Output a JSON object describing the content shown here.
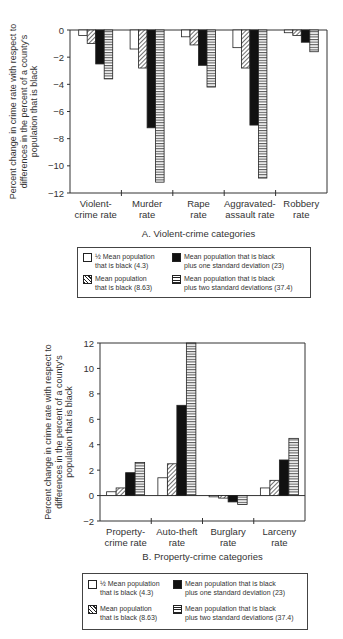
{
  "chart_data": [
    {
      "type": "bar",
      "title": "A. Violent-crime categories",
      "xlabel": "",
      "ylabel": "Percent change in crime rate with respect to differences in the percent of a county's population that is  black",
      "ylim": [
        -12,
        0
      ],
      "yticks": [
        0,
        -2,
        -4,
        -6,
        -8,
        -10,
        -12
      ],
      "grid": false,
      "legend_position": "below",
      "categories": [
        "Violent-crime rate",
        "Murder rate",
        "Rape rate",
        "Aggravated-assault rate",
        "Robbery rate"
      ],
      "category_lines": [
        [
          "Violent-",
          "crime rate"
        ],
        [
          "Murder",
          "rate"
        ],
        [
          "Rape",
          "rate"
        ],
        [
          "Aggravated-",
          "assault rate"
        ],
        [
          "Robbery",
          "rate"
        ]
      ],
      "series": [
        {
          "name": "1/2 Mean population that is black (4.3)",
          "pattern": "white",
          "values": [
            -0.4,
            -1.4,
            -0.5,
            -1.3,
            -0.2
          ]
        },
        {
          "name": "Mean population that is black (8.63)",
          "pattern": "hatch",
          "values": [
            -1.0,
            -2.8,
            -1.1,
            -2.8,
            -0.4
          ]
        },
        {
          "name": "Mean population that is black plus one standard deviation (23)",
          "pattern": "black",
          "values": [
            -2.5,
            -7.2,
            -2.6,
            -7.0,
            -0.9
          ]
        },
        {
          "name": "Mean population that is black plus two standard deviations (37.4)",
          "pattern": "lines",
          "values": [
            -3.6,
            -11.2,
            -4.2,
            -10.9,
            -1.6
          ]
        }
      ]
    },
    {
      "type": "bar",
      "title": "B. Property-crime categories",
      "xlabel": "",
      "ylabel": "Percent change in crime rate with respect to differences in the percent of a county's population that is  black",
      "ylim": [
        -2,
        12
      ],
      "yticks": [
        12,
        10,
        8,
        6,
        4,
        2,
        0,
        -2
      ],
      "grid": false,
      "legend_position": "below",
      "categories": [
        "Property-crime rate",
        "Auto-theft rate",
        "Burglary rate",
        "Larceny rate"
      ],
      "category_lines": [
        [
          "Property-",
          "crime rate"
        ],
        [
          "Auto-theft",
          "rate"
        ],
        [
          "Burglary",
          "rate"
        ],
        [
          "Larceny",
          "rate"
        ]
      ],
      "series": [
        {
          "name": "1/2 Mean population that is black (4.3)",
          "pattern": "white",
          "values": [
            0.3,
            1.4,
            -0.1,
            0.6
          ]
        },
        {
          "name": "Mean population that is black (8.63)",
          "pattern": "hatch",
          "values": [
            0.6,
            2.5,
            -0.2,
            1.2
          ]
        },
        {
          "name": "Mean population that is black plus one standard deviation (23)",
          "pattern": "black",
          "values": [
            1.8,
            7.1,
            -0.5,
            2.8
          ]
        },
        {
          "name": "Mean population that is black plus two standard deviations (37.4)",
          "pattern": "lines",
          "values": [
            2.6,
            12.0,
            -0.7,
            4.5
          ]
        }
      ]
    }
  ],
  "ylabel_lines": [
    "Percent change in crime rate with respect to",
    "differences in the percent of a county's",
    "population that is  black"
  ],
  "legend": [
    {
      "pattern": "white",
      "lines": [
        "½ Mean population",
        "that is black (4.3)"
      ]
    },
    {
      "pattern": "black",
      "lines": [
        "Mean population that is black",
        "plus one standard deviation (23)"
      ]
    },
    {
      "pattern": "hatch",
      "lines": [
        "Mean population",
        "that is black (8.63)"
      ]
    },
    {
      "pattern": "lines",
      "lines": [
        "Mean population that is black",
        "plus two standard deviations (37.4)"
      ]
    }
  ],
  "captions": {
    "a": "A. Violent-crime categories",
    "b": "B. Property-crime categories"
  }
}
